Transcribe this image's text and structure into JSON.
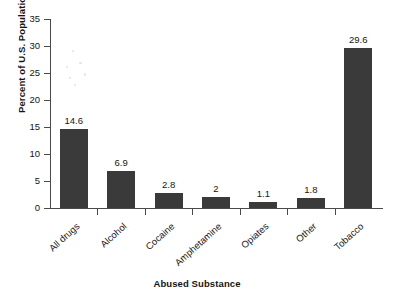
{
  "chart_data": {
    "type": "bar",
    "title": "",
    "xlabel": "Abused Substance",
    "ylabel": "Percent of U.S. Population",
    "categories": [
      "All drugs",
      "Alcohol",
      "Cocaine",
      "Amphetamine",
      "Opiates",
      "Other",
      "Tobacco"
    ],
    "values": [
      14.6,
      6.9,
      2.8,
      2,
      1.1,
      1.8,
      29.6
    ],
    "value_labels": [
      "14.6",
      "6.9",
      "2.8",
      "2",
      "1.1",
      "1.8",
      "29.6"
    ],
    "ylim": [
      0,
      35
    ],
    "ytick_labels": [
      "35",
      "30",
      "25",
      "20",
      "15",
      "10",
      "5",
      "0"
    ],
    "ytick_values": [
      35,
      30,
      25,
      20,
      15,
      10,
      5,
      0
    ],
    "grid": false,
    "legend": false,
    "legend_position": "none",
    "bar_color": "#3a3a3a",
    "axis_color": "#4a4a4a",
    "text_color": "#151515",
    "background_color": "#ffffff",
    "category_label_rotation_deg": -42
  }
}
